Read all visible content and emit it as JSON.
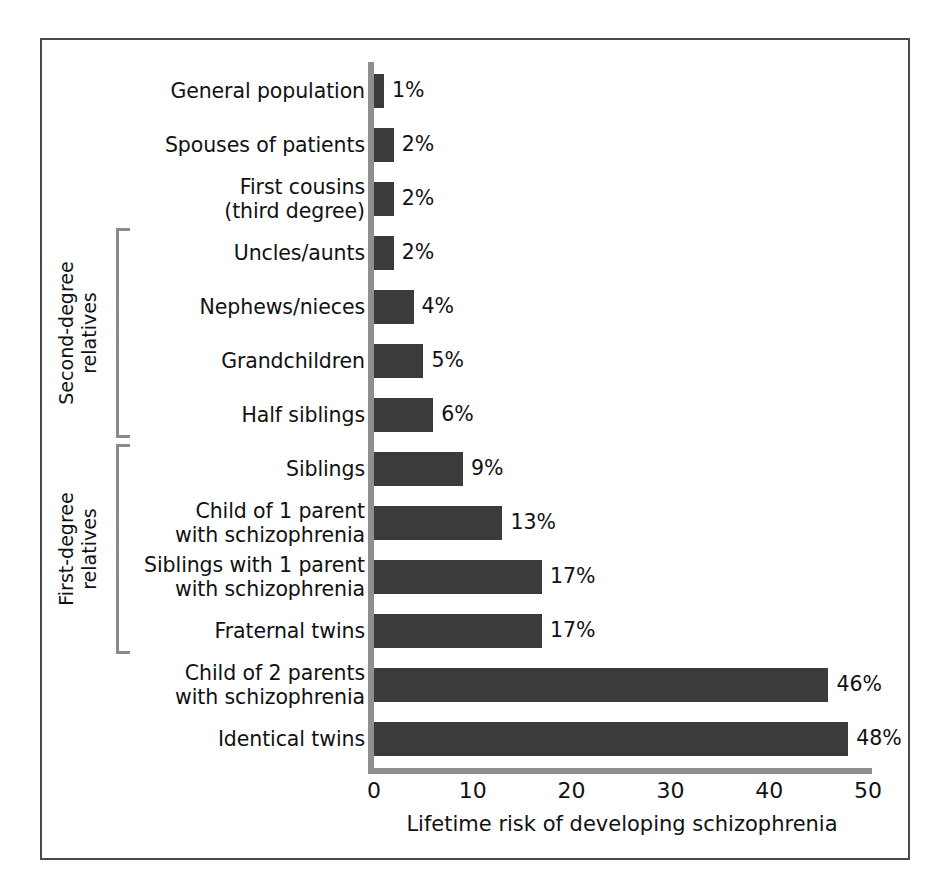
{
  "chart_data": {
    "type": "bar",
    "orientation": "horizontal",
    "title": "",
    "xlabel": "Lifetime risk of developing schizophrenia",
    "ylabel": "",
    "xlim": [
      0,
      50
    ],
    "xticks": [
      "0",
      "10",
      "20",
      "30",
      "40",
      "50"
    ],
    "grid": false,
    "legend": null,
    "bar_color": "#3b3b3b",
    "axis_color": "#8f8f8f",
    "categories": [
      "General population",
      "Spouses of patients",
      "First cousins\n(third degree)",
      "Uncles/aunts",
      "Nephews/nieces",
      "Grandchildren",
      "Half siblings",
      "Siblings",
      "Child of 1 parent\nwith schizophrenia",
      "Siblings with 1 parent\nwith schizophrenia",
      "Fraternal twins",
      "Child of 2 parents\nwith schizophrenia",
      "Identical twins"
    ],
    "values": [
      1,
      2,
      2,
      2,
      4,
      5,
      6,
      9,
      13,
      17,
      17,
      46,
      48
    ],
    "value_labels": [
      "1%",
      "2%",
      "2%",
      "2%",
      "4%",
      "5%",
      "6%",
      "9%",
      "13%",
      "17%",
      "17%",
      "46%",
      "48%"
    ],
    "groups": [
      {
        "label": "Second-degree\nrelatives",
        "first_index": 3,
        "last_index": 6
      },
      {
        "label": "First-degree\nrelatives",
        "first_index": 7,
        "last_index": 10
      }
    ]
  }
}
